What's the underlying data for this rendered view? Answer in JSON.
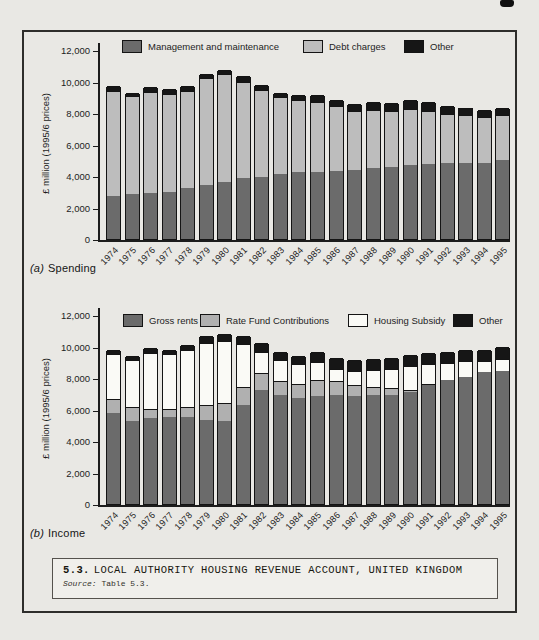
{
  "figure": {
    "caption_number": "5.3.",
    "caption_title": "LOCAL AUTHORITY HOUSING REVENUE ACCOUNT, UNITED KINGDOM",
    "source_label": "Source:",
    "source_text": "Table 5.3."
  },
  "chart_data": [
    {
      "type": "bar",
      "stacked": true,
      "panel_label": "(a)",
      "panel_title": "Spending",
      "ylabel": "£ million (1995/6 prices)",
      "ylim": [
        0,
        12000
      ],
      "yticks": [
        0,
        2000,
        4000,
        6000,
        8000,
        10000,
        12000
      ],
      "ytick_labels": [
        "0",
        "2,000",
        "4,000",
        "6,000",
        "8,000",
        "10,000",
        "12,000"
      ],
      "grid": false,
      "legend_position": "top",
      "categories": [
        "1974",
        "1975",
        "1976",
        "1977",
        "1978",
        "1979",
        "1980",
        "1981",
        "1982",
        "1983",
        "1984",
        "1985",
        "1986",
        "1987",
        "1988",
        "1989",
        "1990",
        "1991",
        "1992",
        "1993",
        "1994",
        "1995"
      ],
      "series": [
        {
          "name": "Management and maintenance",
          "color": "#6b6b6b",
          "values": [
            2700,
            2850,
            2950,
            3000,
            3250,
            3450,
            3650,
            3850,
            3950,
            4150,
            4250,
            4250,
            4300,
            4350,
            4500,
            4600,
            4700,
            4750,
            4800,
            4850,
            4800,
            5000
          ]
        },
        {
          "name": "Debt charges",
          "color": "#bdbdbd",
          "values": [
            6700,
            6200,
            6400,
            6200,
            6150,
            6800,
            6800,
            6150,
            5500,
            4850,
            4600,
            4450,
            4150,
            3750,
            3700,
            3500,
            3550,
            3400,
            3150,
            3050,
            2950,
            2850
          ]
        },
        {
          "name": "Other",
          "color": "#161616",
          "values": [
            300,
            200,
            300,
            300,
            300,
            250,
            250,
            350,
            350,
            250,
            300,
            450,
            400,
            500,
            500,
            550,
            600,
            550,
            500,
            450,
            450,
            450
          ]
        }
      ]
    },
    {
      "type": "bar",
      "stacked": true,
      "panel_label": "(b)",
      "panel_title": "Income",
      "ylabel": "£ million (1995/6 prices)",
      "ylim": [
        0,
        12000
      ],
      "yticks": [
        0,
        2000,
        4000,
        6000,
        8000,
        10000,
        12000
      ],
      "ytick_labels": [
        "0",
        "2,000",
        "4,000",
        "6,000",
        "8,000",
        "10,000",
        "12,000"
      ],
      "grid": false,
      "legend_position": "top",
      "categories": [
        "1974",
        "1975",
        "1976",
        "1977",
        "1978",
        "1979",
        "1980",
        "1981",
        "1982",
        "1983",
        "1984",
        "1985",
        "1986",
        "1987",
        "1988",
        "1989",
        "1990",
        "1991",
        "1992",
        "1993",
        "1994",
        "1995"
      ],
      "series": [
        {
          "name": "Gross rents",
          "color": "#6b6b6b",
          "values": [
            5750,
            5250,
            5450,
            5550,
            5500,
            5350,
            5250,
            6300,
            7250,
            6900,
            6700,
            6850,
            6900,
            6850,
            6900,
            6950,
            7100,
            7550,
            7900,
            8050,
            8350,
            8450
          ]
        },
        {
          "name": "Rate Fund Contributions",
          "color": "#b0b0b0",
          "values": [
            900,
            900,
            600,
            500,
            650,
            950,
            1150,
            1150,
            1100,
            900,
            900,
            1000,
            900,
            700,
            550,
            400,
            150,
            50,
            0,
            0,
            0,
            0
          ]
        },
        {
          "name": "Housing Subsidy",
          "color": "#fafaf6",
          "values": [
            2850,
            3000,
            3550,
            3450,
            3600,
            3950,
            3950,
            2700,
            1300,
            1350,
            1300,
            1150,
            800,
            900,
            1050,
            1250,
            1500,
            1300,
            1050,
            1000,
            750,
            750
          ]
        },
        {
          "name": "Other",
          "color": "#161616",
          "values": [
            300,
            250,
            300,
            300,
            350,
            400,
            450,
            500,
            600,
            500,
            500,
            650,
            700,
            700,
            700,
            700,
            700,
            700,
            700,
            750,
            700,
            750
          ]
        }
      ]
    }
  ]
}
